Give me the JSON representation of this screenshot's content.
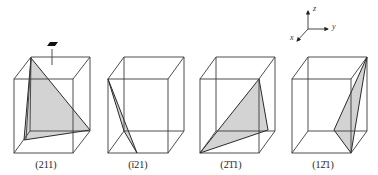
{
  "figure": {
    "cells": [
      {
        "label": "(211)",
        "index": "211"
      },
      {
        "label": "(̅121)",
        "index": "-121",
        "display": "(1̄ 21)"
      },
      {
        "label": "(̅211)",
        "index": "-2-11",
        "display": "(2̄1̄1)"
      },
      {
        "label": "(1̅2 1)",
        "index": "1-21",
        "display": "(12̄1)"
      }
    ],
    "labels": [
      "(211)",
      "(ī21)",
      "(2̄1̄1)",
      "(12̄1)"
    ],
    "axes": {
      "x": "x",
      "y": "y",
      "z": "z"
    },
    "colors": {
      "plane_fill": "#d3d3d3",
      "edge": "#3a3a3a",
      "marker": "#111111"
    }
  }
}
